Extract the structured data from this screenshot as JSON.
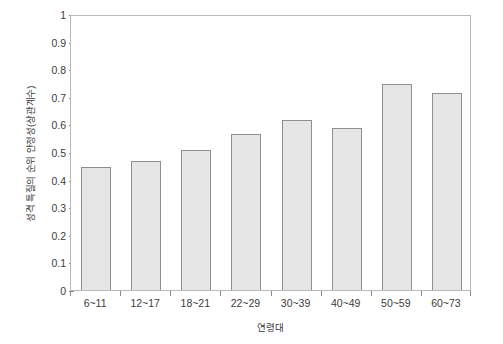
{
  "chart_data": {
    "type": "bar",
    "title": "",
    "xlabel": "연령대",
    "ylabel": "성격 특질의 순위 안정성(상관계수)",
    "categories": [
      "6~11",
      "12~17",
      "18~21",
      "22~29",
      "30~39",
      "40~49",
      "50~59",
      "60~73"
    ],
    "values": [
      0.445,
      0.468,
      0.508,
      0.566,
      0.615,
      0.587,
      0.746,
      0.715
    ],
    "ylim": [
      0,
      1
    ],
    "ytick_labels": [
      "0",
      "0.1",
      "0.2",
      "0.3",
      "0.4",
      "0.5",
      "0.6",
      "0.7",
      "0.8",
      "0.9",
      "1"
    ],
    "ytick_values": [
      0,
      0.1,
      0.2,
      0.3,
      0.4,
      0.5,
      0.6,
      0.7,
      0.8,
      0.9,
      1
    ],
    "grid": false,
    "legend": "none",
    "series": [
      {
        "name": "성격 특질의 순위 안정성",
        "values": [
          0.445,
          0.468,
          0.508,
          0.566,
          0.615,
          0.587,
          0.746,
          0.715
        ]
      }
    ],
    "colors": {
      "bar_fill": "#e6e6e6",
      "bar_border": "#8f8f8f",
      "axis": "#b8b8b8",
      "text": "#3c3c3c",
      "background": "#ffffff"
    }
  }
}
